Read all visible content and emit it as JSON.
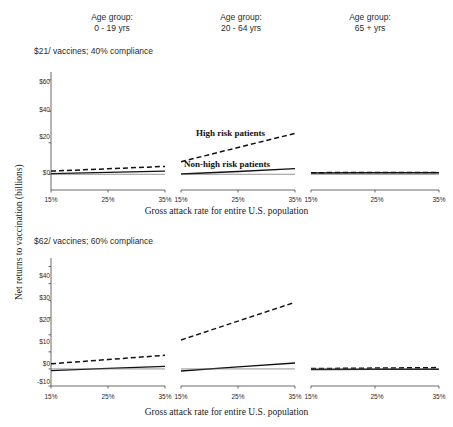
{
  "figure": {
    "column_headers": [
      {
        "line1": "Age group:",
        "line2": "0 - 19 yrs"
      },
      {
        "line1": "Age group:",
        "line2": "20 - 64 yrs"
      },
      {
        "line1": "Age group:",
        "line2": "65 + yrs"
      }
    ],
    "row_titles": [
      "$21/ vaccines; 40% compliance",
      "$62/ vaccines; 60% compliance"
    ],
    "axis_titles": {
      "x": "Gross attack rate for entire U.S. population",
      "y": "Net returns to vaccination (billions)"
    },
    "annotations": [
      "High risk patients",
      "Non-high risk patients"
    ]
  },
  "chart_data": {
    "type": "line",
    "xlabel": "Gross attack rate for entire U.S. population",
    "ylabel": "Net returns to vaccination (billions)",
    "grid": false,
    "legend_position": "in-plot annotation (row 1, middle panel)",
    "x": [
      15,
      25,
      35
    ],
    "xtick_labels": [
      "15%",
      "25%",
      "35%"
    ],
    "xlim": [
      15,
      35
    ],
    "panels": [
      {
        "row": 0,
        "col": 0,
        "row_title": "$21/ vaccines; 40% compliance",
        "col_title": "Age group: 0 - 19 yrs",
        "ylim": [
          -10,
          65
        ],
        "ytick_values": [
          0,
          20,
          40,
          60
        ],
        "ytick_labels": [
          "$0",
          "$20",
          "$40",
          "$60"
        ],
        "series": [
          {
            "name": "High risk patients",
            "style": "dashed",
            "values": [
              2.0,
              3.5,
              5.0
            ]
          },
          {
            "name": "Non-high risk patients",
            "style": "solid",
            "values": [
              0.4,
              1.2,
              2.0
            ]
          },
          {
            "name": "Zero reference",
            "style": "thin-solid",
            "values": [
              0.0,
              0.0,
              0.0
            ]
          }
        ]
      },
      {
        "row": 0,
        "col": 1,
        "row_title": "$21/ vaccines; 40% compliance",
        "col_title": "Age group: 20 - 64 yrs",
        "ylim": [
          -10,
          65
        ],
        "ytick_values": [
          0,
          20,
          40,
          60
        ],
        "ytick_labels": [
          "$0",
          "$20",
          "$40",
          "$60"
        ],
        "series": [
          {
            "name": "High risk patients",
            "style": "dashed",
            "values": [
              8.0,
              17.0,
              26.0
            ]
          },
          {
            "name": "Non-high risk patients",
            "style": "solid",
            "values": [
              0.2,
              1.8,
              3.6
            ]
          },
          {
            "name": "Zero reference",
            "style": "thin-solid",
            "values": [
              0.0,
              0.0,
              0.0
            ]
          }
        ]
      },
      {
        "row": 0,
        "col": 2,
        "row_title": "$21/ vaccines; 40% compliance",
        "col_title": "Age group: 65 + yrs",
        "ylim": [
          -10,
          65
        ],
        "ytick_values": [
          0,
          20,
          40,
          60
        ],
        "ytick_labels": [
          "$0",
          "$20",
          "$40",
          "$60"
        ],
        "series": [
          {
            "name": "High risk patients",
            "style": "dashed",
            "values": [
              1.0,
              1.2,
              1.2
            ]
          },
          {
            "name": "Non-high risk patients",
            "style": "solid",
            "values": [
              0.8,
              1.0,
              1.0
            ]
          },
          {
            "name": "Zero reference",
            "style": "thin-solid",
            "values": [
              0.0,
              0.0,
              0.0
            ]
          }
        ]
      },
      {
        "row": 1,
        "col": 0,
        "row_title": "$62/ vaccines; 60% compliance",
        "col_title": "Age group: 0 - 19 yrs",
        "ylim": [
          -10,
          65
        ],
        "ytick_values": [
          -10,
          0,
          10,
          20,
          30,
          40,
          50,
          60
        ],
        "ytick_labels": [
          "-$10",
          "$0",
          "$10",
          "$20",
          "$30",
          "$40",
          "$50",
          "$60"
        ],
        "series": [
          {
            "name": "High risk patients",
            "style": "dashed",
            "values": [
              3.0,
              5.5,
              8.0
            ]
          },
          {
            "name": "Non-high risk patients",
            "style": "solid",
            "values": [
              -1.0,
              0.3,
              1.5
            ]
          },
          {
            "name": "Zero reference",
            "style": "thin-solid",
            "values": [
              0.0,
              0.0,
              0.0
            ]
          }
        ]
      },
      {
        "row": 1,
        "col": 1,
        "row_title": "$62/ vaccines; 60% compliance",
        "col_title": "Age group: 20 - 64 yrs",
        "ylim": [
          -10,
          65
        ],
        "ytick_values": [
          -10,
          0,
          10,
          20,
          30,
          40,
          50,
          60
        ],
        "ytick_labels": [
          "-$10",
          "$0",
          "$10",
          "$20",
          "$30",
          "$40",
          "$50",
          "$60"
        ],
        "series": [
          {
            "name": "High risk patients",
            "style": "dashed",
            "values": [
              17.0,
              28.0,
              39.0
            ]
          },
          {
            "name": "Non-high risk patients",
            "style": "solid",
            "values": [
              -1.2,
              1.2,
              3.5
            ]
          },
          {
            "name": "Zero reference",
            "style": "thin-solid",
            "values": [
              0.0,
              0.0,
              0.0
            ]
          }
        ]
      },
      {
        "row": 1,
        "col": 2,
        "row_title": "$62/ vaccines; 60% compliance",
        "col_title": "Age group: 65 + yrs",
        "ylim": [
          -10,
          65
        ],
        "ytick_values": [
          -10,
          0,
          10,
          20,
          30,
          40,
          50,
          60
        ],
        "ytick_labels": [
          "-$10",
          "$0",
          "$10",
          "$20",
          "$30",
          "$40",
          "$50",
          "$60"
        ],
        "series": [
          {
            "name": "High risk patients",
            "style": "dashed",
            "values": [
              0.2,
              0.5,
              0.8
            ]
          },
          {
            "name": "Non-high risk patients",
            "style": "solid",
            "values": [
              -0.3,
              -0.2,
              -0.2
            ]
          },
          {
            "name": "Zero reference",
            "style": "thin-solid",
            "values": [
              0.0,
              0.0,
              0.0
            ]
          }
        ]
      }
    ]
  }
}
